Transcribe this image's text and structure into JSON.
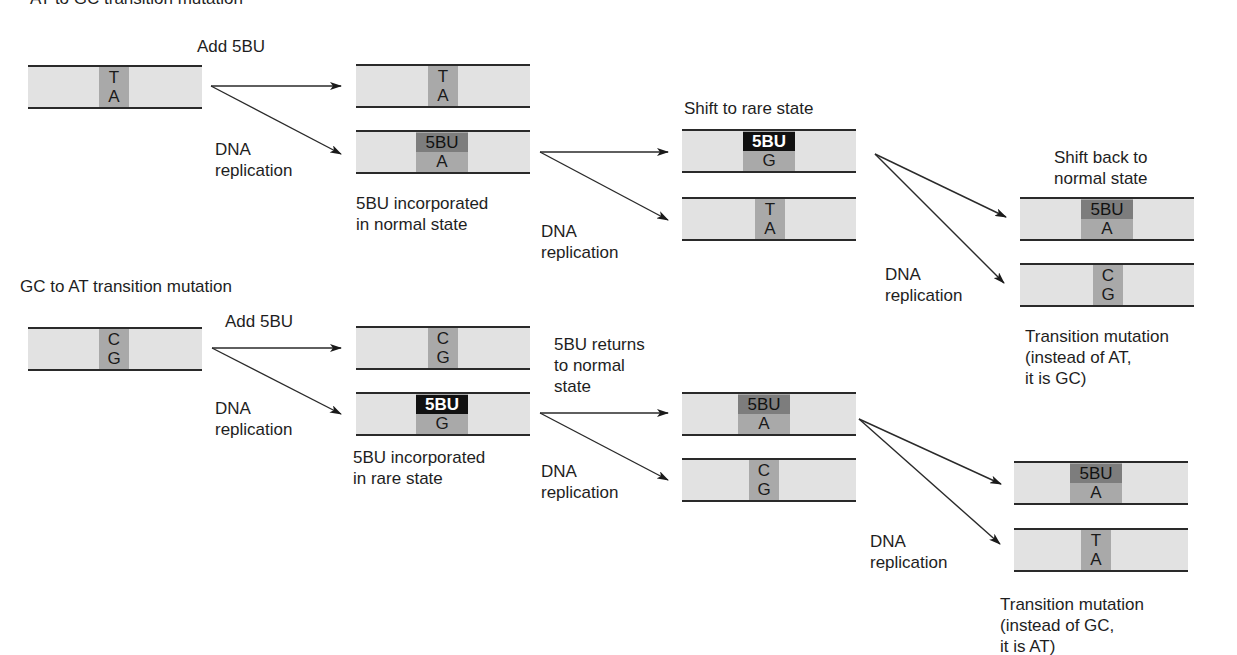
{
  "titles": {
    "at_to_gc": "AT to GC transition mutation",
    "gc_to_at": "GC to AT transition mutation"
  },
  "labels": {
    "add_5bu_top": "Add 5BU",
    "dna_rep_top1": "DNA\nreplication",
    "incorporated_normal": "5BU incorporated\nin normal state",
    "dna_rep_top2": "DNA\nreplication",
    "shift_rare": "Shift to rare state",
    "dna_rep_top3": "DNA\nreplication",
    "shift_back": "Shift back to\nnormal state",
    "result_top": "Transition mutation\n(instead of AT,\nit is GC)",
    "add_5bu_bottom": "Add 5BU",
    "dna_rep_bot1": "DNA\nreplication",
    "incorporated_rare": "5BU incorporated\nin rare state",
    "returns_normal": "5BU returns\nto normal\nstate",
    "dna_rep_bot2": "DNA\nreplication",
    "dna_rep_bot3": "DNA\nreplication",
    "result_bottom": "Transition mutation\n(instead of GC,\nit is AT)"
  },
  "strands": {
    "top_start": {
      "upper": "T",
      "lower": "A"
    },
    "top_copy1": {
      "upper": "T",
      "lower": "A"
    },
    "top_copy2": {
      "upper": "5BU",
      "lower": "A"
    },
    "top_rare": {
      "upper": "5BU",
      "lower": "G"
    },
    "top_ta": {
      "upper": "T",
      "lower": "A"
    },
    "top_back": {
      "upper": "5BU",
      "lower": "A"
    },
    "top_cg": {
      "upper": "C",
      "lower": "G"
    },
    "bot_start": {
      "upper": "C",
      "lower": "G"
    },
    "bot_copy1": {
      "upper": "C",
      "lower": "G"
    },
    "bot_copy2": {
      "upper": "5BU",
      "lower": "G"
    },
    "bot_normal": {
      "upper": "5BU",
      "lower": "A"
    },
    "bot_cg": {
      "upper": "C",
      "lower": "G"
    },
    "bot_final1": {
      "upper": "5BU",
      "lower": "A"
    },
    "bot_final2": {
      "upper": "T",
      "lower": "A"
    }
  },
  "colors": {
    "strand_fill": "#e2e2e2",
    "base_pair_fill": "#a9a9a9",
    "bu_normal_fill": "#7d7d7d",
    "bu_rare_fill": "#111111"
  }
}
